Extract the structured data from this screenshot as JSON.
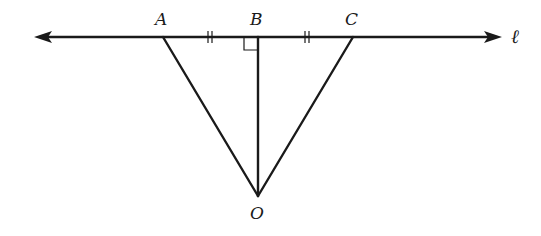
{
  "diagram": {
    "type": "geometry",
    "line_label": "ℓ",
    "points": {
      "A": {
        "label": "A",
        "x": 163,
        "y": 37
      },
      "B": {
        "label": "B",
        "x": 258,
        "y": 37
      },
      "C": {
        "label": "C",
        "x": 353,
        "y": 37
      },
      "O": {
        "label": "O",
        "x": 258,
        "y": 196
      }
    },
    "segments": [
      "OA",
      "OB",
      "OC"
    ],
    "markings": {
      "congruent_ticks": [
        "AB",
        "BC"
      ],
      "right_angle_at": "B"
    },
    "line": {
      "x1": 34,
      "x2": 502,
      "y": 37,
      "arrows": "both"
    }
  }
}
